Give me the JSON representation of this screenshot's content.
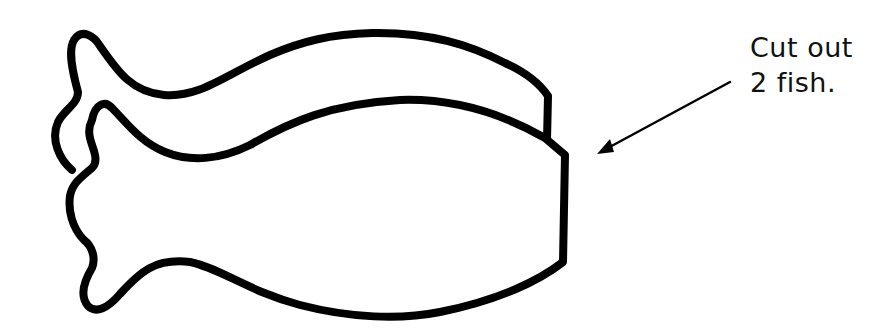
{
  "instruction": {
    "line1": "Cut out",
    "line2": "2 fish."
  },
  "figure": {
    "fish_count_drawn": 2,
    "stroke_color": "#000000",
    "background_color": "#ffffff",
    "arrow": "pointing left-down toward the fish"
  }
}
